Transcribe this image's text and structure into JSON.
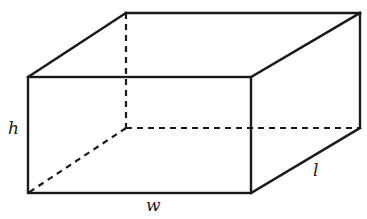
{
  "diagram": {
    "type": "rectangular-prism",
    "stroke_color": "#1a1a1a",
    "background": "#ffffff",
    "vertices": {
      "front_top_left": [
        28,
        77
      ],
      "front_top_right": [
        251,
        77
      ],
      "front_bottom_right": [
        251,
        193
      ],
      "front_bottom_left": [
        28,
        193
      ],
      "back_top_left": [
        126,
        13
      ],
      "back_top_right": [
        360,
        13
      ],
      "back_bottom_right": [
        360,
        128
      ],
      "back_bottom_left": [
        126,
        128
      ]
    },
    "labels": {
      "height": "h",
      "width": "w",
      "length": "l"
    }
  }
}
